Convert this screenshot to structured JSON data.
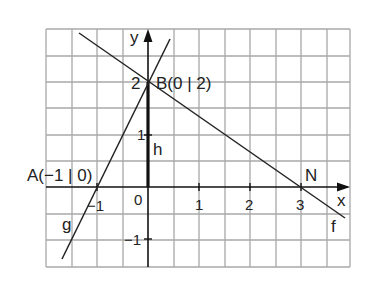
{
  "diagram": {
    "type": "coordinate-graph",
    "grid": {
      "x_lines": [
        46,
        72,
        97,
        123,
        148,
        174,
        199,
        225,
        250,
        276,
        301,
        327,
        350
      ],
      "y_lines": [
        29,
        56,
        82,
        108,
        135,
        161,
        187,
        214,
        240,
        267
      ],
      "color": "#a8a8a8"
    },
    "origin_px": {
      "x": 148,
      "y": 187
    },
    "unit_px": 51,
    "axes": {
      "x_label": "x",
      "y_label": "y",
      "x_ticks": [
        {
          "value": -1,
          "label": "−1"
        },
        {
          "value": 0,
          "label": "0"
        },
        {
          "value": 1,
          "label": "1"
        },
        {
          "value": 2,
          "label": "2"
        },
        {
          "value": 3,
          "label": "3"
        }
      ],
      "y_ticks": [
        {
          "value": -1,
          "label": "−1"
        },
        {
          "value": 1,
          "label": "1"
        },
        {
          "value": 2,
          "label": "2"
        }
      ]
    },
    "points": {
      "A": {
        "label": "A(−1 | 0)",
        "x": -1,
        "y": 0
      },
      "B": {
        "label": "B(0 | 2)",
        "x": 0,
        "y": 2
      },
      "N": {
        "label": "N",
        "x": 3,
        "y": 0
      }
    },
    "lines": {
      "g": {
        "label": "g",
        "slope": 2,
        "intercept": 2
      },
      "f": {
        "label": "f",
        "slope": -0.6667,
        "intercept": 2
      },
      "h": {
        "label": "h",
        "description": "segment from origin to B"
      }
    },
    "colors": {
      "line": "#222222",
      "axis": "#111111",
      "grid": "#a8a8a8"
    }
  }
}
